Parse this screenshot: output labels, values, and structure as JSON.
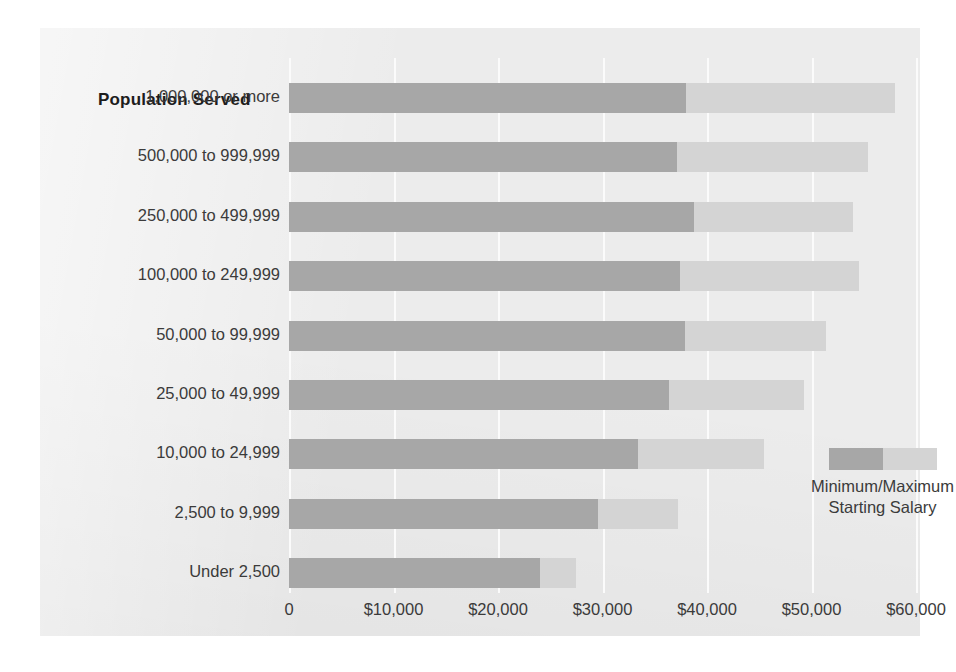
{
  "chart_data": {
    "type": "bar",
    "orientation": "horizontal",
    "subtype": "floating-range",
    "title": "",
    "xlabel": "",
    "ylabel": "Population Served",
    "xlim": [
      0,
      60000
    ],
    "xticks": [
      0,
      10000,
      20000,
      30000,
      40000,
      50000,
      60000
    ],
    "xtick_labels": [
      "0",
      "$10,000",
      "$20,000",
      "$30,000",
      "$40,000",
      "$50,000",
      "$60,000"
    ],
    "grid": true,
    "grid_axis": "x",
    "legend_position": "inside-lower-right",
    "categories": [
      "1,000,000 or more",
      "500,000 to 999,999",
      "250,000 to 499,999",
      "100,000 to 249,999",
      "50,000 to 99,999",
      "25,000 to 49,999",
      "10,000 to 24,999",
      "2,500 to 9,999",
      "Under 2,500"
    ],
    "series": [
      {
        "name": "Minimum Starting Salary",
        "color": "#a7a7a7",
        "values": [
          38000,
          37100,
          38800,
          37400,
          37900,
          36400,
          33400,
          29600,
          24000
        ]
      },
      {
        "name": "Maximum Starting Salary",
        "color": "#d4d4d4",
        "values": [
          58000,
          55400,
          54000,
          54500,
          51400,
          49300,
          45500,
          37200,
          27500
        ]
      }
    ],
    "legend_entries": [
      "Minimum/Maximum",
      "Starting Salary"
    ]
  },
  "axis": {
    "category_header": "Population Served"
  },
  "legend": {
    "line1": "Minimum/Maximum",
    "line2": "Starting Salary"
  },
  "colors": {
    "background": "#ececec",
    "page": "#ffffff",
    "min_bar": "#a7a7a7",
    "max_bar": "#d4d4d4",
    "gridline": "#fbfbfb",
    "text": "#3b3b3b",
    "header_text": "#1d1d1d"
  }
}
